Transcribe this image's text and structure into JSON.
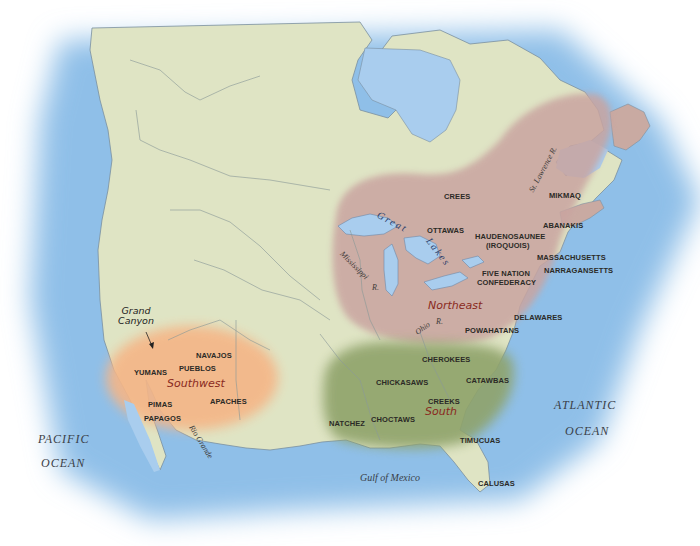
{
  "map": {
    "colors": {
      "ocean": "#9cc6ea",
      "land": "#dfe4c4",
      "northeast_region": "#c9aaa2",
      "southwest_region": "#f4b88a",
      "south_region": "#8fa36a",
      "region_label": "#8a2a1e",
      "lake": "#a9cdee",
      "border": "#8b9a98"
    },
    "regions": [
      {
        "name": "Northeast",
        "tribes": [
          "CREES",
          "OTTAWAS",
          "HAUDENOSAUNEE",
          "(IROQUOIS)",
          "FIVE NATION",
          "CONFEDERACY",
          "MIKMAQ",
          "ABANAKIS",
          "MASSACHUSETTS",
          "NARRAGANSETTS",
          "DELAWARES",
          "POWAHATANS"
        ]
      },
      {
        "name": "Southwest",
        "tribes": [
          "NAVAJOS",
          "PUEBLOS",
          "YUMANS",
          "PIMAS",
          "PAPAGOS",
          "APACHES"
        ]
      },
      {
        "name": "South",
        "tribes": [
          "CHEROKEES",
          "CHICKASAWS",
          "CATAWBAS",
          "CREEKS",
          "CHOCTAWS",
          "NATCHEZ",
          "TIMUCUAS",
          "CALUSAS"
        ]
      }
    ],
    "labels": {
      "crees": "CREES",
      "ottawas": "OTTAWAS",
      "haudenosaunee": "HAUDENOSAUNEE",
      "iroquois": "(IROQUOIS)",
      "five_nation": "FIVE NATION",
      "confederacy": "CONFEDERACY",
      "mikmaq": "MIKMAQ",
      "abanakis": "ABANAKIS",
      "massachusetts": "MASSACHUSETTS",
      "narragansetts": "NARRAGANSETTS",
      "delawares": "DELAWARES",
      "powahatans": "POWAHATANS",
      "northeast": "Northeast",
      "navajos": "NAVAJOS",
      "pueblos": "PUEBLOS",
      "yumans": "YUMANS",
      "southwest": "Southwest",
      "pimas": "PIMAS",
      "papagos": "PAPAGOS",
      "apaches": "APACHES",
      "cherokees": "CHEROKEES",
      "chickasaws": "CHICKASAWS",
      "catawbas": "CATAWBAS",
      "creeks": "CREEKS",
      "south": "South",
      "choctaws": "CHOCTAWS",
      "natchez": "NATCHEZ",
      "timucuas": "TIMUCUAS",
      "calusas": "CALUSAS",
      "grand_canyon_1": "Grand",
      "grand_canyon_2": "Canyon",
      "pacific_1": "PACIFIC",
      "pacific_2": "OCEAN",
      "atlantic_1": "ATLANTIC",
      "atlantic_2": "OCEAN",
      "gulf": "Gulf of Mexico",
      "great": "Great",
      "lakes": "Lakes",
      "mississippi": "Mississippi",
      "mississippi_r": "R.",
      "ohio": "Ohio",
      "ohio_r": "R.",
      "st_lawrence": "St. Lawrence R.",
      "rio_grande": "Rio Grande"
    }
  }
}
